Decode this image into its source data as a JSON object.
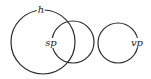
{
  "diagram": {
    "stroke_color": "#2a2a2a",
    "background": "#ffffff",
    "circles": [
      {
        "id": "h",
        "label": "h",
        "cx": 43,
        "cy": 42,
        "r": 32,
        "label_x": 41,
        "label_y": 10
      },
      {
        "id": "sp",
        "label": "sp",
        "cx": 73,
        "cy": 42,
        "r": 21,
        "label_x": 53,
        "label_y": 43
      },
      {
        "id": "vp",
        "label": "vp",
        "cx": 118,
        "cy": 43,
        "r": 20,
        "label_x": 137,
        "label_y": 43
      }
    ]
  }
}
